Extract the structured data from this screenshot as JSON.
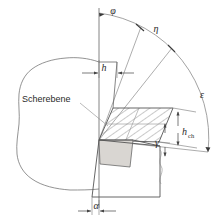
{
  "diagram": {
    "type": "engineering-diagram",
    "colors": {
      "line": "#555555",
      "thin_line": "#777777",
      "hatch": "#666666",
      "chip_fill": "#ffffff",
      "shear_zone_fill": "#d9d6d2",
      "text": "#2a2a2a",
      "background": "#ffffff"
    },
    "labels": {
      "shear_plane": "Scherebene",
      "angle_phi": "φ",
      "angle_eta": "η",
      "angle_epsilon": "ε",
      "angle_gamma": "γ",
      "angle_alpha": "α",
      "dim_h": "h",
      "dim_h_ch_base": "h",
      "dim_h_ch_sub": "ch"
    },
    "parts": [
      {
        "name": "workpiece",
        "description": "irregular blob outline at left"
      },
      {
        "name": "chip",
        "description": "hatched parallelogram flowing up-right"
      },
      {
        "name": "shear-zone",
        "description": "gray filled quadrilateral at cutting edge"
      },
      {
        "name": "tool",
        "description": "wedge body below cutting edge"
      },
      {
        "name": "reference-arc",
        "description": "large arc spanning phi, eta, epsilon"
      }
    ]
  }
}
